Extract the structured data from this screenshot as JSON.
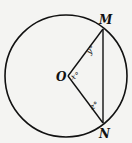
{
  "diagram": {
    "type": "circle-geometry",
    "circle": {
      "center_label": "O",
      "cx": 66,
      "cy": 76,
      "r": 61
    },
    "points": {
      "O": {
        "label": "O",
        "x": 68,
        "y": 76
      },
      "M": {
        "label": "M",
        "x": 103,
        "y": 29
      },
      "N": {
        "label": "N",
        "x": 103,
        "y": 123
      }
    },
    "segments": [
      {
        "from": "O",
        "to": "M",
        "name": "radius OM"
      },
      {
        "from": "O",
        "to": "N",
        "name": "radius ON"
      },
      {
        "from": "M",
        "to": "N",
        "name": "chord MN"
      }
    ],
    "angles": {
      "x": {
        "label": "x°",
        "vertex": "O"
      },
      "y": {
        "label": "y°",
        "vertex": "M"
      },
      "z": {
        "label": "z°",
        "vertex": "N"
      }
    },
    "stroke_color": "#111111",
    "background": "#f4f4f2"
  }
}
